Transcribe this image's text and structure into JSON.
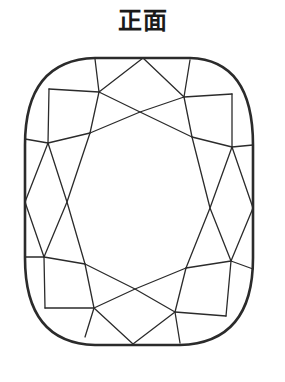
{
  "title": "正面",
  "diagram": {
    "stroke_color": "#2b2b2b",
    "background_color": "#ffffff"
  }
}
